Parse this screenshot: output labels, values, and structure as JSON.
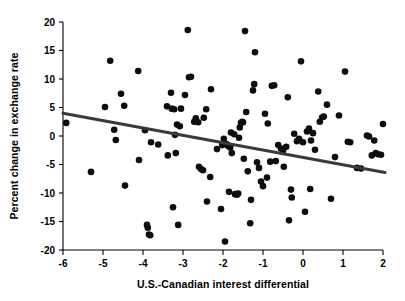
{
  "chart_data": {
    "type": "scatter",
    "title": "",
    "xlabel": "U.S.-Canadian interest differential",
    "ylabel": "Percent change in exchange rate",
    "xlim": [
      -6,
      2
    ],
    "ylim": [
      -20,
      20
    ],
    "xticks": [
      -6,
      -5,
      -4,
      -3,
      -2,
      -1,
      0,
      1,
      2
    ],
    "xtick_labels": [
      "-6",
      "-5",
      "-4",
      "-3",
      "-2",
      "-1",
      "0",
      "1",
      "2"
    ],
    "yticks": [
      -20,
      -15,
      -10,
      -5,
      0,
      5,
      10,
      15,
      20
    ],
    "ytick_labels": [
      "-20",
      "-15",
      "-10",
      "-5",
      "0",
      "5",
      "10",
      "15",
      "20"
    ],
    "grid": false,
    "legend": null,
    "marker_color": "#0d0d0d",
    "marker_size": 3.3,
    "trendline": {
      "label": "least-squares fit",
      "color": "#3a3a3a",
      "x_start": -6,
      "y_start": 4.0,
      "x_end": 2.05,
      "y_end": -6.4,
      "slope": -1.29,
      "intercept": -3.74
    },
    "points": [
      [
        -5.92,
        2.3
      ],
      [
        -5.3,
        -6.3
      ],
      [
        -4.95,
        5.1
      ],
      [
        -4.82,
        13.2
      ],
      [
        -4.72,
        1.1
      ],
      [
        -4.68,
        -0.7
      ],
      [
        -4.55,
        7.4
      ],
      [
        -4.47,
        5.3
      ],
      [
        -4.45,
        -8.7
      ],
      [
        -4.12,
        11.4
      ],
      [
        -4.1,
        -4.2
      ],
      [
        -3.95,
        1.0
      ],
      [
        -3.9,
        -15.6
      ],
      [
        -3.88,
        -16.1
      ],
      [
        -3.85,
        -17.3
      ],
      [
        -3.82,
        -17.4
      ],
      [
        -3.8,
        -1.1
      ],
      [
        -3.62,
        -1.5
      ],
      [
        -3.4,
        5.2
      ],
      [
        -3.38,
        -3.4
      ],
      [
        -3.3,
        7.6
      ],
      [
        -3.28,
        4.8
      ],
      [
        -3.25,
        -12.5
      ],
      [
        -3.22,
        4.7
      ],
      [
        -3.2,
        0.2
      ],
      [
        -3.18,
        -3.0
      ],
      [
        -3.15,
        2.0
      ],
      [
        -3.12,
        -15.6
      ],
      [
        -3.08,
        1.7
      ],
      [
        -2.95,
        7.2
      ],
      [
        -2.88,
        18.6
      ],
      [
        -2.85,
        10.3
      ],
      [
        -2.8,
        10.4
      ],
      [
        -2.72,
        2.5
      ],
      [
        -2.68,
        3.1
      ],
      [
        -2.62,
        2.4
      ],
      [
        -2.6,
        -5.4
      ],
      [
        -2.55,
        -5.8
      ],
      [
        -2.5,
        -6.0
      ],
      [
        -2.48,
        3.2
      ],
      [
        -2.42,
        4.7
      ],
      [
        -2.4,
        -11.5
      ],
      [
        -2.32,
        -7.2
      ],
      [
        -2.3,
        8.2
      ],
      [
        -2.15,
        -2.3
      ],
      [
        -2.05,
        -12.8
      ],
      [
        -1.98,
        -0.5
      ],
      [
        -1.95,
        -18.5
      ],
      [
        -1.9,
        -1.5
      ],
      [
        -1.88,
        -1.7
      ],
      [
        -1.85,
        -9.8
      ],
      [
        -1.82,
        -2.0
      ],
      [
        -1.8,
        0.6
      ],
      [
        -1.78,
        -3.0
      ],
      [
        -1.72,
        0.3
      ],
      [
        -1.7,
        -10.2
      ],
      [
        -1.65,
        -10.3
      ],
      [
        -1.62,
        -10.1
      ],
      [
        -1.6,
        -0.3
      ],
      [
        -1.58,
        1.5
      ],
      [
        -1.55,
        2.3
      ],
      [
        -1.52,
        2.5
      ],
      [
        -1.5,
        2.4
      ],
      [
        -1.48,
        -4.0
      ],
      [
        -1.45,
        18.4
      ],
      [
        -1.42,
        4.2
      ],
      [
        -1.38,
        -6.2
      ],
      [
        -1.32,
        -15.3
      ],
      [
        -1.3,
        -11.2
      ],
      [
        -1.25,
        8.0
      ],
      [
        -1.22,
        9.1
      ],
      [
        -1.2,
        14.7
      ],
      [
        -1.15,
        -4.6
      ],
      [
        -1.1,
        -5.6
      ],
      [
        -1.05,
        -8.0
      ],
      [
        -1.0,
        -8.8
      ],
      [
        -0.95,
        3.9
      ],
      [
        -0.9,
        -7.3
      ],
      [
        -0.88,
        2.2
      ],
      [
        -0.82,
        -4.5
      ],
      [
        -0.78,
        8.8
      ],
      [
        -0.72,
        8.9
      ],
      [
        -0.68,
        -4.4
      ],
      [
        -0.55,
        -2.2
      ],
      [
        -0.5,
        -2.6
      ],
      [
        -0.48,
        -5.4
      ],
      [
        -0.42,
        -1.9
      ],
      [
        -0.38,
        6.8
      ],
      [
        -0.35,
        -14.8
      ],
      [
        -0.3,
        -9.4
      ],
      [
        -0.28,
        -10.8
      ],
      [
        -0.22,
        0.4
      ],
      [
        -0.15,
        -0.9
      ],
      [
        -0.1,
        -0.5
      ],
      [
        -0.05,
        13.1
      ],
      [
        0.0,
        -1.1
      ],
      [
        0.05,
        -13.3
      ],
      [
        0.1,
        0.8
      ],
      [
        0.15,
        1.3
      ],
      [
        0.18,
        -9.3
      ],
      [
        0.2,
        -0.8
      ],
      [
        0.25,
        0.5
      ],
      [
        0.3,
        -2.4
      ],
      [
        0.38,
        7.8
      ],
      [
        0.42,
        2.5
      ],
      [
        0.48,
        3.3
      ],
      [
        0.52,
        3.4
      ],
      [
        0.6,
        5.5
      ],
      [
        0.7,
        -11.0
      ],
      [
        0.8,
        -3.7
      ],
      [
        0.9,
        3.6
      ],
      [
        1.05,
        11.3
      ],
      [
        1.12,
        -1.0
      ],
      [
        1.18,
        -1.1
      ],
      [
        1.35,
        -5.6
      ],
      [
        1.45,
        -5.7
      ],
      [
        1.6,
        0.1
      ],
      [
        1.65,
        -0.1
      ],
      [
        1.72,
        -3.4
      ],
      [
        1.78,
        -0.8
      ],
      [
        1.82,
        -3.0
      ],
      [
        1.95,
        -3.3
      ],
      [
        2.0,
        2.1
      ],
      [
        -3.05,
        4.8
      ],
      [
        -2.02,
        -1.6
      ],
      [
        -1.92,
        -1.4
      ],
      [
        -0.62,
        -1.6
      ],
      [
        1.88,
        -3.2
      ]
    ]
  }
}
